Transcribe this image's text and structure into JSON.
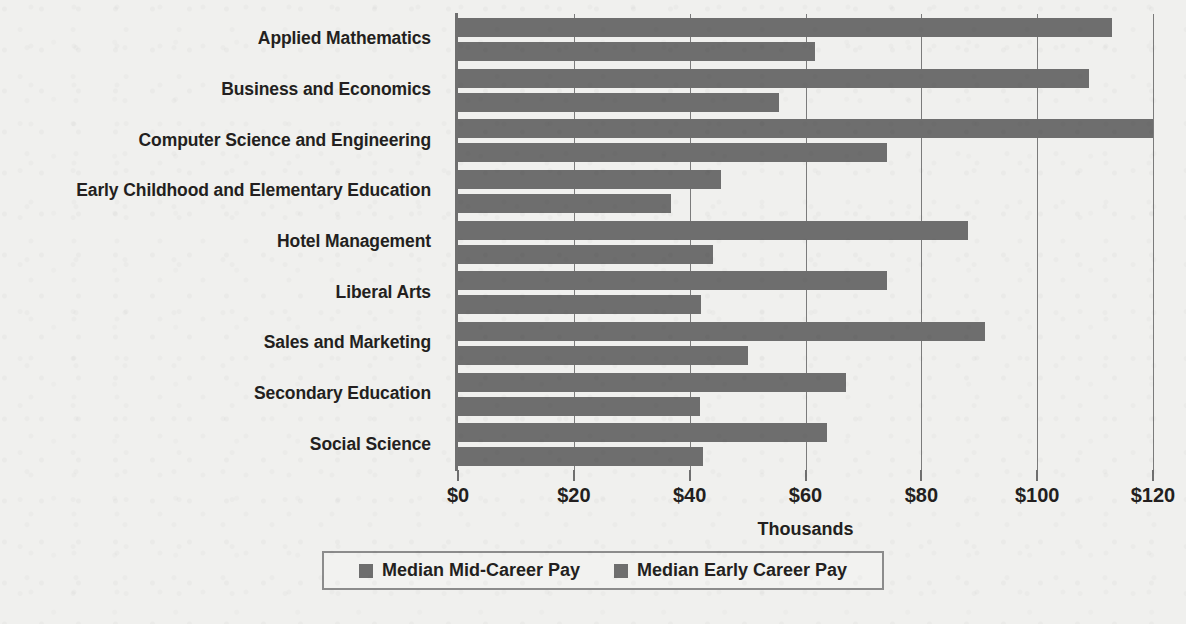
{
  "chart_data": {
    "type": "bar",
    "orientation": "horizontal",
    "title": "",
    "xlabel": "Thousands",
    "ylabel": "",
    "xlim": [
      0,
      120
    ],
    "xticks": [
      0,
      20,
      40,
      60,
      80,
      100,
      120
    ],
    "xtick_labels": [
      "$0",
      "$20",
      "$40",
      "$60",
      "$80",
      "$100",
      "$120"
    ],
    "grid": true,
    "legend_position": "bottom",
    "categories": [
      "Applied Mathematics",
      "Business and Economics",
      "Computer Science and Engineering",
      "Early Childhood and Elementary Education",
      "Hotel Management",
      "Liberal Arts",
      "Sales and Marketing",
      "Secondary Education",
      "Social Science"
    ],
    "series": [
      {
        "name": "Median Mid-Career Pay",
        "color": "#6e6e6e",
        "values": [
          113,
          109,
          120,
          45.4,
          88,
          74,
          91,
          67,
          63.7
        ]
      },
      {
        "name": "Median Early Career Pay",
        "color": "#6e6e6e",
        "values": [
          61.7,
          55.5,
          74,
          36.7,
          44,
          42,
          50,
          41.7,
          42.3
        ]
      }
    ]
  },
  "legend": {
    "items": [
      {
        "label": "Median Mid-Career Pay",
        "swatch": "legend-swatch-icon"
      },
      {
        "label": "Median Early Career Pay",
        "swatch": "legend-swatch-icon"
      }
    ]
  },
  "axis": {
    "x_title": "Thousands"
  }
}
